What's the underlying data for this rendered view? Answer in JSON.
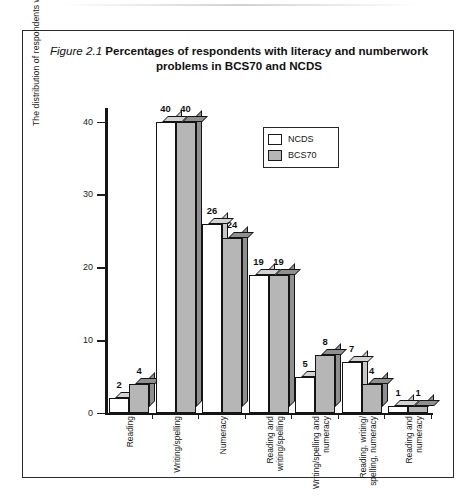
{
  "figure": {
    "number": "Figure 2.1",
    "title": "Percentages of respondents with literacy and numberwork problems in BCS70 and NCDS"
  },
  "chart_data": {
    "type": "bar",
    "title": "Figure 2.1 Percentages of respondents with literacy and numberwork problems in BCS70 and NCDS",
    "xlabel": "",
    "ylabel": "The distribution of respondents with difficulties",
    "ylim": [
      0,
      42
    ],
    "yticks": [
      0,
      10,
      20,
      30,
      40
    ],
    "ytick_labels": [
      "0",
      "10",
      "20",
      "30",
      "40"
    ],
    "grid": false,
    "legend_position": "upper-center",
    "categories": [
      "Reading",
      "Writing/spelling",
      "Numeracy",
      "Reading and writing/spelling",
      "Writing/spelling and numeracy",
      "Reading, writing/ spelling, numeracy",
      "Reading and numeracy"
    ],
    "series": [
      {
        "name": "NCDS",
        "color": "#ffffff",
        "values": [
          2,
          40,
          26,
          19,
          5,
          7,
          1
        ]
      },
      {
        "name": "BCS70",
        "color": "#b6b6b6",
        "values": [
          4,
          40,
          24,
          19,
          8,
          4,
          1
        ]
      }
    ]
  },
  "legend": {
    "items": [
      {
        "label": "NCDS",
        "swatch": "white-square-swatch"
      },
      {
        "label": "BCS70",
        "swatch": "gray-square-swatch"
      }
    ]
  },
  "colors": {
    "bar_ncds": "#ffffff",
    "bar_bcs70": "#b6b6b6",
    "outline": "#141414",
    "frame": "#2b2b2b"
  }
}
